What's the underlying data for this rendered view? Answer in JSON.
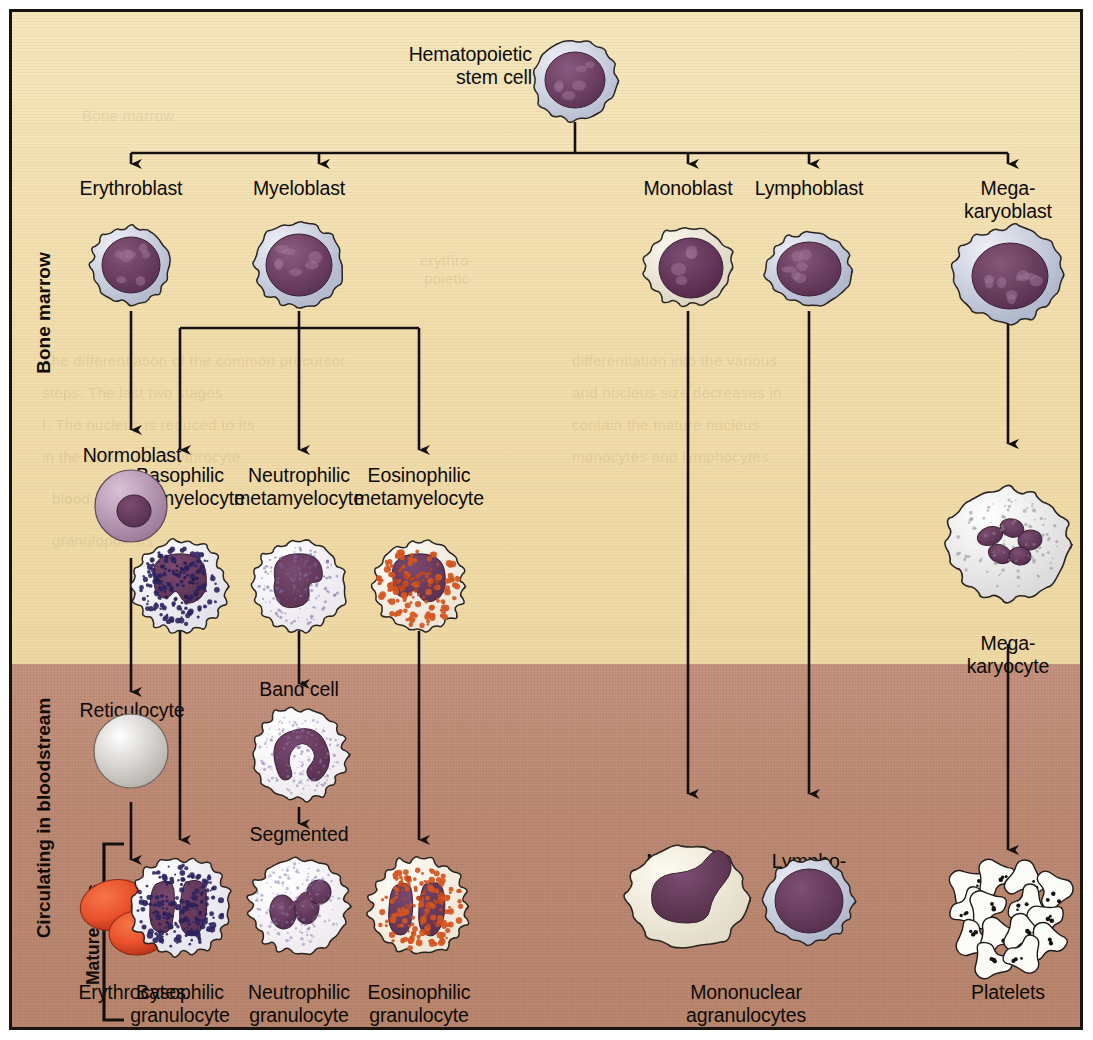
{
  "figure": {
    "colors": {
      "bone_marrow_bg": "#f1dcaa",
      "bloodstream_bg": "#bd8b75",
      "nucleus_purple": "#6b3d62",
      "cytoplasm_blue_grey": "#ccd0dc",
      "cytoplasm_cream": "#f7f2e4",
      "erythrocyte_red": "#e8512a",
      "eosinophil_granule": "#d4551f",
      "basophil_granule": "#2d2460",
      "frame_black": "#1a1410"
    }
  },
  "side_labels": [
    {
      "id": "bone-marrow",
      "text": "Bone marrow"
    },
    {
      "id": "circulating",
      "text": "Circulating in bloodstream"
    },
    {
      "id": "mature-cells",
      "text": "Mature cells"
    }
  ],
  "nodes": {
    "stem_cell": {
      "label": "Hematopoietic\nstem cell"
    },
    "erythroblast": {
      "label": "Erythroblast"
    },
    "myeloblast": {
      "label": "Myeloblast"
    },
    "monoblast": {
      "label": "Monoblast"
    },
    "lymphoblast": {
      "label": "Lymphoblast"
    },
    "megakaryoblast": {
      "label": "Mega-\nkaryoblast"
    },
    "normoblast": {
      "label": "Normoblast"
    },
    "baso_meta": {
      "label": "Basophilic\nmetamyelocyte"
    },
    "neutro_meta": {
      "label": "Neutrophilic\nmetamyelocyte"
    },
    "eosino_meta": {
      "label": "Eosinophilic\nmetamyelocyte"
    },
    "megakaryocyte": {
      "label": "Mega-\nkaryocyte"
    },
    "reticulocyte": {
      "label": "Reticulocyte"
    },
    "band_cell": {
      "label": "Band cell"
    },
    "segmented": {
      "label": "Segmented"
    },
    "monocyte": {
      "label": "Monocyte"
    },
    "lymphocyte": {
      "label": "Lympho-\ncyte"
    },
    "erythrocytes": {
      "label": "Erythrocytes"
    },
    "baso_gran": {
      "label": "Basophilic\ngranulocyte"
    },
    "neutro_gran": {
      "label": "Neutrophilic\ngranulocyte"
    },
    "eosino_gran": {
      "label": "Eosinophilic\ngranulocyte"
    },
    "mononuclear": {
      "label": "Mononuclear\nagranulocytes"
    },
    "platelets": {
      "label": "Platelets"
    }
  },
  "ghost_text": [
    {
      "t": "Bone marrow",
      "x": 70,
      "y": 95
    },
    {
      "t": "erythro-",
      "x": 408,
      "y": 240
    },
    {
      "t": "poietic",
      "x": 412,
      "y": 258
    },
    {
      "t": "The differentiation of the common precursor",
      "x": 30,
      "y": 340
    },
    {
      "t": "steps. The last two stages",
      "x": 30,
      "y": 372
    },
    {
      "t": "I. The nucleus is reduced to its",
      "x": 30,
      "y": 404
    },
    {
      "t": "in the blood. The erythrocyte",
      "x": 30,
      "y": 436
    },
    {
      "t": "differentiation into the various",
      "x": 560,
      "y": 340
    },
    {
      "t": "and nucleus size decreases in",
      "x": 560,
      "y": 372
    },
    {
      "t": "contain the mature nucleus",
      "x": 560,
      "y": 404
    },
    {
      "t": "monocytes and lymphocytes",
      "x": 560,
      "y": 436
    },
    {
      "t": "blood cells",
      "x": 40,
      "y": 478
    },
    {
      "t": "granulopoiesis",
      "x": 40,
      "y": 520
    }
  ]
}
